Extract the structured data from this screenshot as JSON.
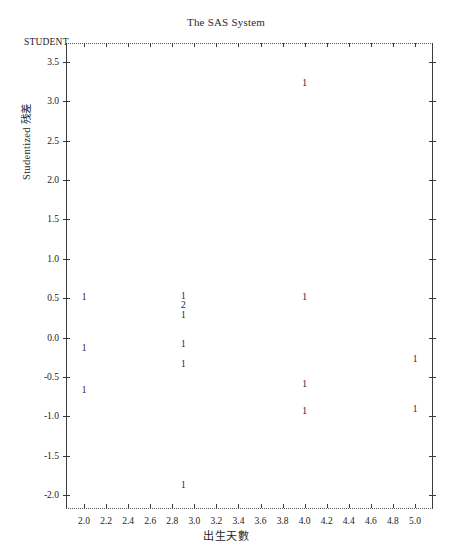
{
  "title": "The SAS System",
  "corner_label": "STUDENT",
  "axes": {
    "y_title": "Studentized 残差",
    "x_title": "出生天數",
    "y_ticks": [
      "3.5",
      "3.0",
      "2.5",
      "2.0",
      "1.5",
      "1.0",
      "0.5",
      "0.0",
      "-0.5",
      "-1.0",
      "-1.5",
      "-2.0"
    ],
    "x_ticks": [
      "2.0",
      "2.2",
      "2.4",
      "2.6",
      "2.8",
      "3.0",
      "3.2",
      "3.4",
      "3.6",
      "3.8",
      "4.0",
      "4.2",
      "4.4",
      "4.6",
      "4.8",
      "5.0"
    ]
  },
  "chart_data": {
    "type": "scatter",
    "title": "The SAS System",
    "xlabel": "出生天數",
    "ylabel": "Studentized 残差",
    "legend": "",
    "grid": false,
    "xlim": [
      1.9,
      5.1
    ],
    "ylim": [
      -2.05,
      3.6
    ],
    "point_label_meaning": "count of overlapping observations",
    "points": [
      {
        "x": 4.0,
        "y": 3.22,
        "label": "1"
      },
      {
        "x": 2.0,
        "y": 0.5,
        "label": "1"
      },
      {
        "x": 2.9,
        "y": 0.52,
        "label": "1"
      },
      {
        "x": 2.9,
        "y": 0.4,
        "label": "2"
      },
      {
        "x": 2.9,
        "y": 0.28,
        "label": "1"
      },
      {
        "x": 4.0,
        "y": 0.5,
        "label": "1"
      },
      {
        "x": 2.0,
        "y": -0.15,
        "label": "1"
      },
      {
        "x": 2.9,
        "y": -0.1,
        "label": "1"
      },
      {
        "x": 2.9,
        "y": -0.35,
        "label": "1"
      },
      {
        "x": 5.0,
        "y": -0.28,
        "label": "1"
      },
      {
        "x": 2.0,
        "y": -0.68,
        "label": "1"
      },
      {
        "x": 4.0,
        "y": -0.6,
        "label": "1"
      },
      {
        "x": 4.0,
        "y": -0.95,
        "label": "1"
      },
      {
        "x": 5.0,
        "y": -0.92,
        "label": "1"
      },
      {
        "x": 2.9,
        "y": -1.88,
        "label": "1"
      }
    ]
  }
}
